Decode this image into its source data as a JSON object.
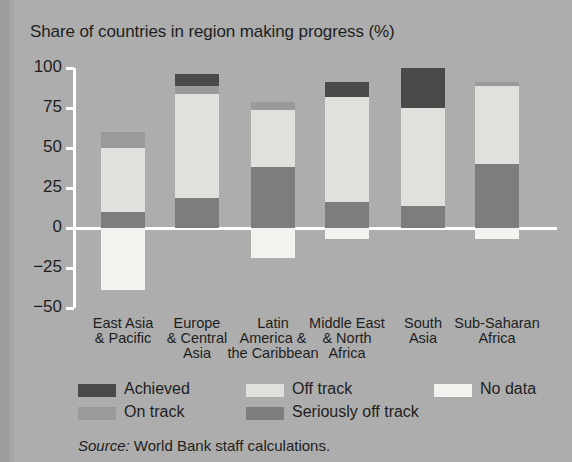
{
  "chart_data": {
    "type": "bar",
    "stacked": true,
    "title": "Share of countries in region making progress (%)",
    "xlabel": "",
    "ylabel": "",
    "ylim": [
      -50,
      100
    ],
    "yticks": [
      100,
      75,
      50,
      25,
      0,
      -25,
      -50
    ],
    "ytick_labels": [
      "100",
      "75",
      "50",
      "25",
      "0",
      "−25",
      "−50"
    ],
    "grid": false,
    "legend_position": "bottom",
    "categories": [
      "East Asia & Pacific",
      "Europe & Central Asia",
      "Latin America & the Caribbean",
      "Middle East & North Africa",
      "South Asia",
      "Sub-Saharan Africa"
    ],
    "category_label_lines": [
      [
        "East Asia",
        "& Pacific"
      ],
      [
        "Europe",
        "& Central",
        "Asia"
      ],
      [
        "Latin",
        "America &",
        "the Caribbean"
      ],
      [
        "Middle East",
        "& North",
        "Africa"
      ],
      [
        "South",
        "Asia"
      ],
      [
        "Sub-Saharan",
        "Africa"
      ]
    ],
    "series": [
      {
        "name": "Achieved",
        "color": "#4a4a4a",
        "values": [
          0,
          7.5,
          0,
          9,
          25,
          0
        ]
      },
      {
        "name": "On track",
        "color": "#9a9a9a",
        "values": [
          10,
          5,
          5,
          0,
          0,
          2
        ]
      },
      {
        "name": "Off track",
        "color": "#e0e0dc",
        "values": [
          40,
          65,
          36,
          66,
          61,
          49
        ]
      },
      {
        "name": "Seriously off track",
        "color": "#7d7d7d",
        "values": [
          10,
          19,
          38,
          16,
          14,
          40
        ]
      },
      {
        "name": "No data",
        "color": "#f2f2ee",
        "values": [
          -39,
          0,
          -19,
          -7,
          0,
          -7
        ]
      }
    ],
    "segment_tops": {
      "East Asia & Pacific": {
        "stack_top": 60,
        "on_track_top": 60,
        "off_track_top": 50,
        "seriously_top": 10,
        "no_data_bottom": -39
      },
      "Europe & Central Asia": {
        "stack_top": 95,
        "achieved_top": 95,
        "on_track_top": 87.5,
        "off_track_top": 82.5,
        "seriously_top": 19,
        "no_data_bottom": 0
      },
      "Latin America & the Caribbean": {
        "stack_top": 80,
        "on_track_top": 80,
        "off_track_top": 75,
        "seriously_top": 38,
        "no_data_bottom": -19
      },
      "Middle East & North Africa": {
        "stack_top": 91,
        "achieved_top": 91,
        "off_track_top": 82,
        "seriously_top": 16,
        "no_data_bottom": -7
      },
      "South Asia": {
        "stack_top": 100,
        "achieved_top": 100,
        "off_track_top": 75,
        "seriously_top": 14,
        "no_data_bottom": 0
      },
      "Sub-Saharan Africa": {
        "stack_top": 91,
        "on_track_top": 91,
        "off_track_top": 89,
        "seriously_top": 40,
        "no_data_bottom": -7
      }
    },
    "legend": [
      {
        "label": "Achieved",
        "color": "#4a4a4a"
      },
      {
        "label": "On track",
        "color": "#9a9a9a"
      },
      {
        "label": "Off track",
        "color": "#e0e0dc"
      },
      {
        "label": "Seriously off track",
        "color": "#7d7d7d"
      },
      {
        "label": "No data",
        "color": "#f2f2ee"
      }
    ]
  },
  "source": {
    "prefix": "Source:",
    "text": " World Bank staff calculations."
  },
  "colors": {
    "background": "#adadad",
    "axis": "#ffffff",
    "text": "#1e1e1e"
  }
}
